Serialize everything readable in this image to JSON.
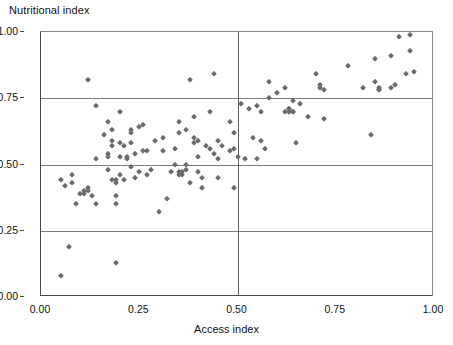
{
  "chart_data": {
    "type": "scatter",
    "title": "",
    "xlabel": "Access index",
    "ylabel": "Nutritional index",
    "xlim": [
      0.0,
      1.0
    ],
    "ylim": [
      0.0,
      1.0
    ],
    "xticks": [
      "0.00",
      "0.25",
      "0.50",
      "0.75",
      "1.00"
    ],
    "yticks": [
      "0.00",
      "0.25",
      "0.50",
      "0.75",
      "1.00"
    ],
    "xtick_values": [
      0.0,
      0.25,
      0.5,
      0.75,
      1.0
    ],
    "ytick_values": [
      0.0,
      0.25,
      0.5,
      0.75,
      1.0
    ],
    "grid": true,
    "gridlines_h": [
      0.25,
      0.5,
      0.75
    ],
    "gridlines_v": [
      0.5
    ],
    "legend": null,
    "marker": "diamond",
    "marker_color": "#6b6b6b",
    "axis_color": "#4a4a4a",
    "grid_color": "#7d7d7d",
    "n_points": 142,
    "points": [
      [
        0.05,
        0.08
      ],
      [
        0.07,
        0.19
      ],
      [
        0.19,
        0.13
      ],
      [
        0.05,
        0.44
      ],
      [
        0.06,
        0.42
      ],
      [
        0.08,
        0.46
      ],
      [
        0.08,
        0.43
      ],
      [
        0.09,
        0.35
      ],
      [
        0.1,
        0.39
      ],
      [
        0.11,
        0.39
      ],
      [
        0.11,
        0.4
      ],
      [
        0.12,
        0.4
      ],
      [
        0.12,
        0.41
      ],
      [
        0.13,
        0.38
      ],
      [
        0.14,
        0.35
      ],
      [
        0.12,
        0.82
      ],
      [
        0.14,
        0.72
      ],
      [
        0.14,
        0.52
      ],
      [
        0.16,
        0.61
      ],
      [
        0.17,
        0.48
      ],
      [
        0.17,
        0.54
      ],
      [
        0.17,
        0.53
      ],
      [
        0.17,
        0.66
      ],
      [
        0.18,
        0.63
      ],
      [
        0.18,
        0.57
      ],
      [
        0.18,
        0.44
      ],
      [
        0.18,
        0.59
      ],
      [
        0.19,
        0.43
      ],
      [
        0.19,
        0.44
      ],
      [
        0.19,
        0.38
      ],
      [
        0.19,
        0.35
      ],
      [
        0.2,
        0.7
      ],
      [
        0.2,
        0.58
      ],
      [
        0.2,
        0.53
      ],
      [
        0.2,
        0.46
      ],
      [
        0.21,
        0.44
      ],
      [
        0.21,
        0.57
      ],
      [
        0.22,
        0.52
      ],
      [
        0.22,
        0.53
      ],
      [
        0.23,
        0.63
      ],
      [
        0.23,
        0.62
      ],
      [
        0.23,
        0.58
      ],
      [
        0.23,
        0.49
      ],
      [
        0.24,
        0.45
      ],
      [
        0.24,
        0.54
      ],
      [
        0.25,
        0.64
      ],
      [
        0.25,
        0.47
      ],
      [
        0.26,
        0.65
      ],
      [
        0.26,
        0.55
      ],
      [
        0.27,
        0.46
      ],
      [
        0.27,
        0.55
      ],
      [
        0.28,
        0.48
      ],
      [
        0.29,
        0.59
      ],
      [
        0.3,
        0.32
      ],
      [
        0.31,
        0.55
      ],
      [
        0.31,
        0.6
      ],
      [
        0.32,
        0.37
      ],
      [
        0.33,
        0.47
      ],
      [
        0.34,
        0.56
      ],
      [
        0.34,
        0.5
      ],
      [
        0.35,
        0.46
      ],
      [
        0.35,
        0.47
      ],
      [
        0.35,
        0.66
      ],
      [
        0.35,
        0.62
      ],
      [
        0.36,
        0.46
      ],
      [
        0.36,
        0.47
      ],
      [
        0.37,
        0.63
      ],
      [
        0.37,
        0.5
      ],
      [
        0.37,
        0.48
      ],
      [
        0.38,
        0.82
      ],
      [
        0.38,
        0.43
      ],
      [
        0.39,
        0.6
      ],
      [
        0.39,
        0.58
      ],
      [
        0.39,
        0.68
      ],
      [
        0.4,
        0.59
      ],
      [
        0.4,
        0.53
      ],
      [
        0.4,
        0.47
      ],
      [
        0.41,
        0.45
      ],
      [
        0.41,
        0.41
      ],
      [
        0.42,
        0.57
      ],
      [
        0.43,
        0.7
      ],
      [
        0.43,
        0.56
      ],
      [
        0.44,
        0.84
      ],
      [
        0.44,
        0.54
      ],
      [
        0.45,
        0.59
      ],
      [
        0.45,
        0.52
      ],
      [
        0.45,
        0.45
      ],
      [
        0.46,
        0.57
      ],
      [
        0.48,
        0.66
      ],
      [
        0.48,
        0.55
      ],
      [
        0.49,
        0.62
      ],
      [
        0.49,
        0.56
      ],
      [
        0.49,
        0.41
      ],
      [
        0.5,
        0.53
      ],
      [
        0.51,
        0.73
      ],
      [
        0.52,
        0.52
      ],
      [
        0.53,
        0.71
      ],
      [
        0.54,
        0.6
      ],
      [
        0.55,
        0.72
      ],
      [
        0.55,
        0.52
      ],
      [
        0.56,
        0.59
      ],
      [
        0.56,
        0.7
      ],
      [
        0.57,
        0.56
      ],
      [
        0.58,
        0.81
      ],
      [
        0.58,
        0.75
      ],
      [
        0.6,
        0.77
      ],
      [
        0.62,
        0.79
      ],
      [
        0.62,
        0.7
      ],
      [
        0.63,
        0.71
      ],
      [
        0.63,
        0.7
      ],
      [
        0.63,
        0.7
      ],
      [
        0.63,
        0.71
      ],
      [
        0.64,
        0.7
      ],
      [
        0.64,
        0.74
      ],
      [
        0.64,
        0.7
      ],
      [
        0.65,
        0.58
      ],
      [
        0.66,
        0.73
      ],
      [
        0.68,
        0.68
      ],
      [
        0.7,
        0.84
      ],
      [
        0.71,
        0.79
      ],
      [
        0.71,
        0.8
      ],
      [
        0.72,
        0.78
      ],
      [
        0.72,
        0.67
      ],
      [
        0.78,
        0.87
      ],
      [
        0.82,
        0.79
      ],
      [
        0.84,
        0.61
      ],
      [
        0.85,
        0.9
      ],
      [
        0.85,
        0.81
      ],
      [
        0.86,
        0.79
      ],
      [
        0.86,
        0.78
      ],
      [
        0.86,
        0.78
      ],
      [
        0.89,
        0.91
      ],
      [
        0.89,
        0.79
      ],
      [
        0.9,
        0.8
      ],
      [
        0.91,
        0.98
      ],
      [
        0.93,
        0.84
      ],
      [
        0.94,
        0.93
      ],
      [
        0.94,
        0.99
      ],
      [
        0.95,
        0.85
      ]
    ]
  }
}
